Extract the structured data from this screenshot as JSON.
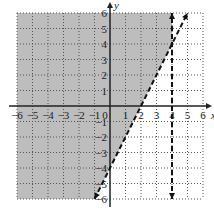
{
  "chart_data": {
    "type": "area",
    "title": "",
    "xlabel": "x",
    "ylabel": "y",
    "xlim": [
      -6,
      6
    ],
    "ylim": [
      -6,
      6
    ],
    "grid": true,
    "grid_style": "dotted",
    "x_ticks": [
      "-6",
      "-5",
      "-4",
      "-3",
      "-2",
      "-1",
      "0",
      "1",
      "2",
      "3",
      "4",
      "5",
      "6"
    ],
    "y_ticks": [
      "6",
      "5",
      "4",
      "3",
      "2",
      "1",
      "-1",
      "-2",
      "-3",
      "-4",
      "-5",
      "-6"
    ],
    "boundaries": [
      {
        "name": "slanted-line",
        "equation": "y = 2x - 4",
        "style": "dashed",
        "from": [
          -1,
          -6
        ],
        "to": [
          5,
          6
        ]
      },
      {
        "name": "vertical-line",
        "equation": "x = 4",
        "style": "dashed",
        "from": [
          4,
          -6
        ],
        "to": [
          4,
          6
        ]
      }
    ],
    "shaded_region": {
      "description": "y > 2x - 4 and x < 4",
      "polygon": [
        [
          -6,
          6
        ],
        [
          4,
          6
        ],
        [
          4,
          4
        ],
        [
          -1,
          -6
        ],
        [
          -6,
          -6
        ]
      ],
      "color": "#bdbdbd"
    }
  },
  "colors": {
    "shade": "#bdbdbd",
    "grid": "#555555",
    "axis": "#222222",
    "background": "#ffffff"
  }
}
